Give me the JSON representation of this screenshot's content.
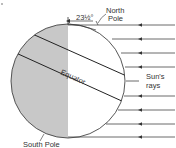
{
  "diagram": {
    "labels": {
      "angle": "23½°",
      "north_pole_line1": "North",
      "north_pole_line2": "Pole",
      "equator": "Equator",
      "sun_rays_line1": "Sun's",
      "sun_rays_line2": "rays",
      "south_pole": "South Pole"
    },
    "colors": {
      "night_shade": "#c8c8c8",
      "line": "#333333",
      "background": "#ffffff"
    },
    "ray_count": 9
  }
}
